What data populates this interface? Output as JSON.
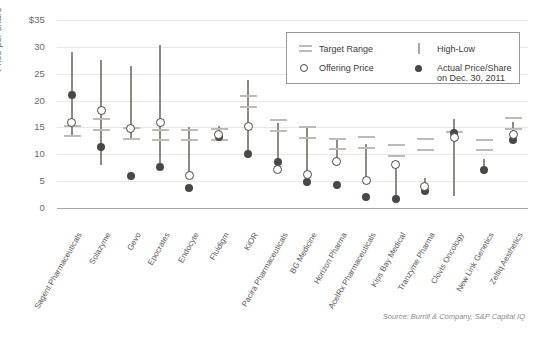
{
  "axis": {
    "y_title": "Price per share",
    "y_ticks": [
      "$35",
      "30",
      "25",
      "20",
      "15",
      "10",
      "5",
      "0"
    ]
  },
  "legend": {
    "target_range": "Target Range",
    "high_low": "High-Low",
    "offering_price": "Offering Price",
    "actual_price_line1": "Actual Price/Share",
    "actual_price_line2": "on Dec. 30, 2011",
    "icons": {
      "target_range": "double-bar-icon",
      "high_low": "vertical-bar-icon",
      "offering_price": "open-circle-icon",
      "actual_price": "filled-circle-icon"
    }
  },
  "source": "Source: Burrill & Company, S&P Capital IQ",
  "colors": {
    "high_low": "#8d8a86",
    "target_range": "#bdbbb8",
    "actual": "#4a4846",
    "offering_outline": "#4a4846",
    "grid": "#e9e7e4",
    "axis": "#a9a6a2",
    "text": "#5d5a57"
  },
  "chart_data": {
    "type": "scatter",
    "title": "",
    "subtitle": "",
    "xlabel": "",
    "ylabel": "Price per share",
    "ylim": [
      0,
      35
    ],
    "yticks": [
      0,
      5,
      10,
      15,
      20,
      25,
      30,
      35
    ],
    "grid": true,
    "legend_position": "top-right",
    "categories": [
      "Sagent Pharmaceuticals",
      "Solazyme",
      "Gevo",
      "Epocrates",
      "Endocyte",
      "Fluidigm",
      "KiOR",
      "Pacira Pharmaceuticals",
      "BG Medicine",
      "Horizon Pharma",
      "AcelRx Pharmaceuticals",
      "Kips Bay Medical",
      "Tranzyme Pharma",
      "Clovis Oncology",
      "New Link Genetics",
      "Zeltiq Aesthetics"
    ],
    "series": [
      {
        "name": "High-Low",
        "type": "range",
        "high": [
          29.0,
          27.5,
          26.5,
          30.3,
          15.0,
          15.2,
          23.8,
          15.8,
          15.3,
          13.1,
          11.9,
          8.3,
          5.6,
          16.5,
          9.2,
          16.0
        ],
        "low": [
          13.5,
          8.0,
          12.7,
          7.6,
          6.4,
          12.7,
          9.5,
          6.7,
          6.0,
          7.9,
          4.8,
          1.6,
          3.3,
          2.2,
          7.1,
          12.7
        ]
      },
      {
        "name": "Target Range",
        "type": "band",
        "upper": [
          15.5,
          16.7,
          15.0,
          14.8,
          14.8,
          14.9,
          21.0,
          16.5,
          15.3,
          13.1,
          13.4,
          11.9,
          13.0,
          14.3,
          12.9,
          16.9
        ],
        "lower": [
          13.5,
          14.8,
          13.0,
          12.8,
          12.8,
          12.9,
          19.0,
          14.5,
          13.3,
          11.1,
          11.4,
          9.9,
          11.0,
          14.3,
          11.0,
          14.9
        ]
      },
      {
        "name": "Offering Price",
        "type": "point",
        "values": [
          15.8,
          18.0,
          14.8,
          15.8,
          6.0,
          13.5,
          15.0,
          7.0,
          6.2,
          8.6,
          5.0,
          8.0,
          4.0,
          13.0,
          null,
          13.5
        ]
      },
      {
        "name": "Actual Price/Share on Dec. 30, 2011",
        "type": "point",
        "values": [
          21.0,
          11.3,
          6.0,
          7.6,
          3.8,
          13.2,
          10.0,
          8.5,
          4.8,
          4.3,
          2.1,
          1.7,
          3.2,
          13.9,
          7.1,
          12.6
        ]
      }
    ]
  }
}
